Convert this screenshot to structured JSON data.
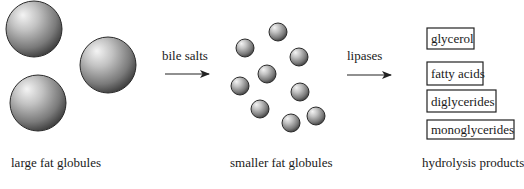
{
  "diagram": {
    "stages": [
      {
        "id": "large",
        "label": "large fat globules",
        "globule_count": 3
      },
      {
        "id": "small",
        "label": "smaller fat globules",
        "globule_count": 9
      },
      {
        "id": "products",
        "label": "hydrolysis products"
      }
    ],
    "arrows": [
      {
        "label": "bile salts",
        "from": "large",
        "to": "small"
      },
      {
        "label": "lipases",
        "from": "small",
        "to": "products"
      }
    ],
    "products": [
      "glycerol",
      "fatty acids",
      "diglycerides",
      "monoglycerides"
    ],
    "colors": {
      "sphere_light": "#f2f2f2",
      "sphere_mid": "#a8a8a8",
      "sphere_dark": "#3a3a3a",
      "stroke": "#222222"
    }
  }
}
